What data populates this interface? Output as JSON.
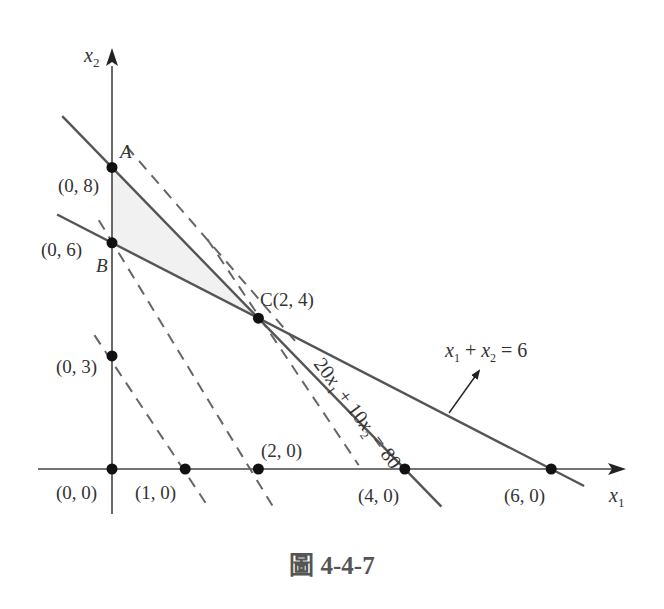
{
  "figure": {
    "caption": "圖 4-4-7",
    "axes": {
      "x_label": "x",
      "x_sub": "1",
      "y_label": "x",
      "y_sub": "2"
    },
    "colors": {
      "line": "#555555",
      "dash": "#666666",
      "point": "#111111",
      "feasible_fill": "#f1f1f1",
      "text": "#333333"
    }
  },
  "chart_data": {
    "type": "line",
    "title": "圖 4-4-7",
    "xlabel": "x1",
    "ylabel": "x2",
    "constraints": [
      {
        "label": "20x1 + 10x2 = 80",
        "x_intercept": 4,
        "y_intercept": 8,
        "style": "solid"
      },
      {
        "label": "x1 + x2 = 6",
        "x_intercept": 6,
        "y_intercept": 6,
        "style": "solid"
      }
    ],
    "iso_lines": [
      {
        "x_intercept": 1.5,
        "y_intercept": 3,
        "style": "dashed"
      },
      {
        "x_intercept": 2,
        "y_intercept": 4,
        "style": "dashed"
      },
      {
        "x_intercept": 3.3,
        "y_intercept": 6.6,
        "style": "dashed"
      },
      {
        "x_intercept": 4.5,
        "y_intercept": 9,
        "style": "dashed"
      }
    ],
    "feasible_region": [
      [
        0,
        8
      ],
      [
        0,
        6
      ],
      [
        2,
        4
      ]
    ],
    "points": [
      {
        "label": "(0, 0)",
        "x": 0,
        "y": 0
      },
      {
        "label": "(1, 0)",
        "x": 1,
        "y": 0
      },
      {
        "label": "(2, 0)",
        "x": 2,
        "y": 0
      },
      {
        "label": "(4, 0)",
        "x": 4,
        "y": 0
      },
      {
        "label": "(6, 0)",
        "x": 6,
        "y": 0
      },
      {
        "label": "(0, 3)",
        "x": 0,
        "y": 3
      },
      {
        "label": "(0, 6)",
        "x": 0,
        "y": 6,
        "name": "B"
      },
      {
        "label": "(0, 8)",
        "x": 0,
        "y": 8,
        "name": "A"
      },
      {
        "label": "C(2, 4)",
        "x": 2,
        "y": 4,
        "name": "C"
      }
    ],
    "annotations": [
      {
        "text": "A",
        "at": [
          0,
          8
        ]
      },
      {
        "text": "B",
        "at": [
          0,
          6
        ]
      },
      {
        "text": "C(2, 4)",
        "at": [
          2,
          4
        ]
      },
      {
        "text": "x1 + x2 = 6",
        "arrow_to_line": true
      },
      {
        "text": "20x1 + 10x2 = 80",
        "rotated_along_line": true
      }
    ],
    "xlim": [
      -1,
      7
    ],
    "ylim": [
      -0.9,
      9.5
    ],
    "grid": false
  }
}
